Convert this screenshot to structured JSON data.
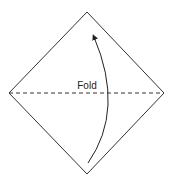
{
  "diagram": {
    "fold_label": "Fold",
    "colors": {
      "stroke": "#333333",
      "text": "#222222",
      "background": "#ffffff"
    },
    "shape": "square-rotated-45",
    "fold_line": "horizontal-dashed-diagonal",
    "arrow": "curved-up-bottom-to-top"
  }
}
